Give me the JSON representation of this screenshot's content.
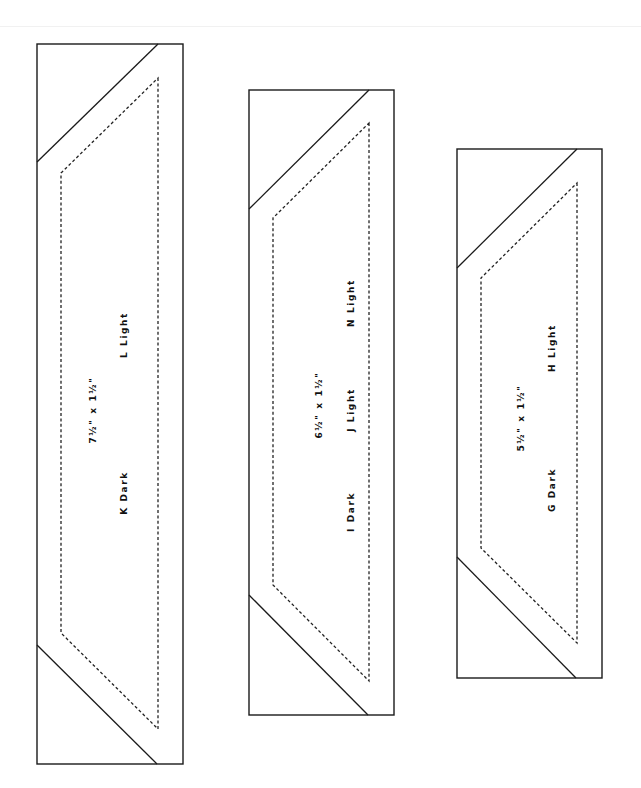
{
  "diagram": {
    "type": "quilt-template-strips",
    "colors": {
      "outline": "#1a1a1a",
      "seam_line": "#222222",
      "background": "#ffffff"
    },
    "pieces": [
      {
        "id": "strip-1",
        "size_label": "7½\" x 1½\"",
        "patches": [
          {
            "label": "L Light"
          },
          {
            "label": "K Dark"
          }
        ]
      },
      {
        "id": "strip-2",
        "size_label": "6½\" x 1½\"",
        "patches": [
          {
            "label": "N Light"
          },
          {
            "label": "J Light"
          },
          {
            "label": "I Dark"
          }
        ]
      },
      {
        "id": "strip-3",
        "size_label": "5½\" x 1½\"",
        "patches": [
          {
            "label": "H Light"
          },
          {
            "label": "G Dark"
          }
        ]
      }
    ]
  }
}
